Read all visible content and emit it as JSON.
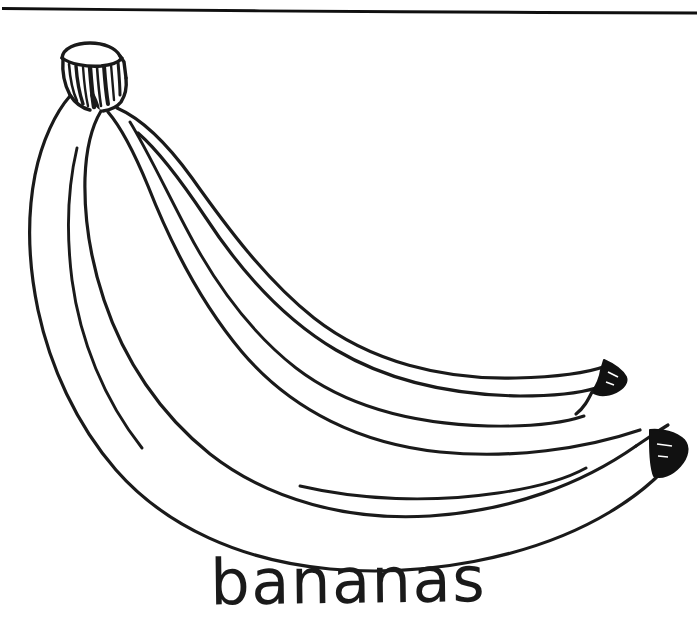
{
  "page": {
    "title": "bananas",
    "kind": "line-art coloring page",
    "width": 697,
    "height": 641,
    "background_color": "#ffffff",
    "ink_color": "#1a1a1a"
  },
  "border": {
    "name": "top-rule",
    "description": "hand-drawn horizontal line across the top of the sheet",
    "stroke_color": "#101010"
  },
  "illustration": {
    "subject": "bananas",
    "subject_count": 4,
    "description": "a hand-drawn bunch of four bananas joined at a striated crown stem at the upper left, curving down and to the right, with two dark filled tips at the right",
    "parts": {
      "stem": "banana-crown-stem",
      "stem_detail": "vertical striations",
      "tips": [
        "upper-banana-tip",
        "lower-banana-tip"
      ],
      "tip_fill": "#111111"
    }
  },
  "caption": {
    "text": "bananas",
    "style": "handwritten lowercase"
  }
}
